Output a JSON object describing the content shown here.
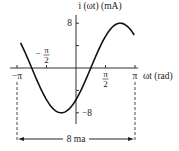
{
  "chart_data": {
    "type": "line",
    "title": "",
    "ylabel": "i (ωt) (mA)",
    "xlabel": "ωt (rad)",
    "function": "i = 8 sin(ωt − π/4)",
    "amplitude": 8,
    "phase": -0.7854,
    "xlim": [
      -3.1416,
      3.1416
    ],
    "ylim": [
      -8,
      8
    ],
    "x_ticks": [
      {
        "value": -3.1416,
        "label": "−π"
      },
      {
        "value": -1.5708,
        "label_num": "π",
        "label_den": "2",
        "sign": "−"
      },
      {
        "value": 1.5708,
        "label_num": "π",
        "label_den": "2",
        "sign": ""
      },
      {
        "value": 3.1416,
        "label": "π"
      }
    ],
    "y_ticks": [
      {
        "value": 8,
        "label": "8"
      },
      {
        "value": 4,
        "label": ""
      },
      {
        "value": -4,
        "label": ""
      },
      {
        "value": -8,
        "label": "−8"
      }
    ],
    "annotation": "8 ma",
    "grid": false
  }
}
